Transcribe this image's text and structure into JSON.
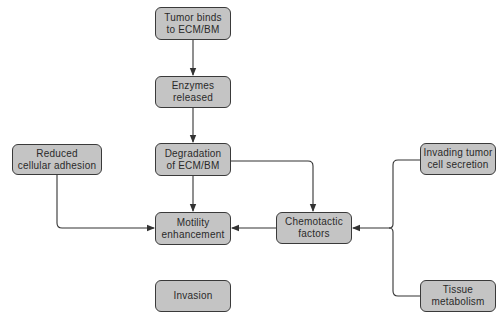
{
  "diagram": {
    "type": "flowchart",
    "colors": {
      "node_fill": "#c4c4c4",
      "node_border": "#3a3a3a",
      "edge": "#333333",
      "text": "#2a2a2a"
    },
    "nodes": [
      {
        "id": "tumor_binds",
        "label": "Tumor binds\nto ECM/BM"
      },
      {
        "id": "enzymes",
        "label": "Enzymes\nreleased"
      },
      {
        "id": "degradation",
        "label": "Degradation\nof ECM/BM"
      },
      {
        "id": "reduced_adhesion",
        "label": "Reduced\ncellular adhesion"
      },
      {
        "id": "motility",
        "label": "Motility\nenhancement"
      },
      {
        "id": "chemotactic",
        "label": "Chemotactic\nfactors"
      },
      {
        "id": "invading_secretion",
        "label": "Invading tumor\ncell secretion"
      },
      {
        "id": "tissue_metabolism",
        "label": "Tissue\nmetabolism"
      },
      {
        "id": "invasion",
        "label": "Invasion"
      }
    ],
    "edges": [
      {
        "from": "tumor_binds",
        "to": "enzymes"
      },
      {
        "from": "enzymes",
        "to": "degradation"
      },
      {
        "from": "degradation",
        "to": "motility"
      },
      {
        "from": "degradation",
        "to": "chemotactic"
      },
      {
        "from": "reduced_adhesion",
        "to": "motility"
      },
      {
        "from": "chemotactic",
        "to": "motility"
      },
      {
        "from": "invading_secretion",
        "to": "chemotactic",
        "via": "brace"
      },
      {
        "from": "tissue_metabolism",
        "to": "chemotactic",
        "via": "brace"
      },
      {
        "from": "motility",
        "to": "invasion"
      }
    ]
  }
}
